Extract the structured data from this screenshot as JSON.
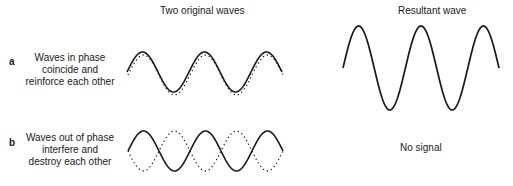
{
  "headers": {
    "left": "Two original waves",
    "right": "Resultant wave"
  },
  "rows": [
    {
      "letter": "a",
      "lines": [
        "Waves in phase",
        "coincide and",
        "reinforce each other"
      ],
      "wave1": {
        "style": "solid",
        "phase_deg": 0,
        "cycles": 2.5
      },
      "wave2": {
        "style": "dotted",
        "phase_deg": 0,
        "cycles": 2.5
      },
      "result": {
        "type": "wave",
        "amplitude_ratio": 2,
        "cycles": 2.5
      }
    },
    {
      "letter": "b",
      "lines": [
        "Waves out of phase",
        "interfere and",
        "destroy each other"
      ],
      "wave1": {
        "style": "solid",
        "phase_deg": 0,
        "cycles": 2.5
      },
      "wave2": {
        "style": "dotted",
        "phase_deg": 180,
        "cycles": 2.5
      },
      "result": {
        "type": "text",
        "label": "No signal"
      }
    }
  ],
  "colors": {
    "ink": "#1a1a1a",
    "background": "#ffffff"
  }
}
